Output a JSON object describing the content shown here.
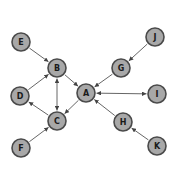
{
  "diagram": {
    "type": "directed-graph",
    "node_radius": 9,
    "colors": {
      "node_fill": "#a8a8a8",
      "node_stroke": "#4a4a4a",
      "edge": "#555555",
      "background": "#ffffff"
    },
    "nodes": [
      {
        "id": "A",
        "label": "A",
        "x": 86,
        "y": 93
      },
      {
        "id": "B",
        "label": "B",
        "x": 57,
        "y": 68
      },
      {
        "id": "C",
        "label": "C",
        "x": 57,
        "y": 121
      },
      {
        "id": "D",
        "label": "D",
        "x": 20,
        "y": 96
      },
      {
        "id": "E",
        "label": "E",
        "x": 21,
        "y": 42
      },
      {
        "id": "F",
        "label": "F",
        "x": 21,
        "y": 148
      },
      {
        "id": "G",
        "label": "G",
        "x": 121,
        "y": 68
      },
      {
        "id": "H",
        "label": "H",
        "x": 123,
        "y": 122
      },
      {
        "id": "I",
        "label": "I",
        "x": 157,
        "y": 94
      },
      {
        "id": "J",
        "label": "J",
        "x": 155,
        "y": 37
      },
      {
        "id": "K",
        "label": "K",
        "x": 157,
        "y": 146
      }
    ],
    "edges": [
      {
        "from": "E",
        "to": "B",
        "bidirectional": false
      },
      {
        "from": "D",
        "to": "B",
        "bidirectional": false
      },
      {
        "from": "B",
        "to": "C",
        "bidirectional": true
      },
      {
        "from": "B",
        "to": "A",
        "bidirectional": false
      },
      {
        "from": "A",
        "to": "C",
        "bidirectional": false
      },
      {
        "from": "C",
        "to": "D",
        "bidirectional": false
      },
      {
        "from": "F",
        "to": "C",
        "bidirectional": false
      },
      {
        "from": "J",
        "to": "G",
        "bidirectional": false
      },
      {
        "from": "G",
        "to": "A",
        "bidirectional": false
      },
      {
        "from": "A",
        "to": "I",
        "bidirectional": true
      },
      {
        "from": "H",
        "to": "A",
        "bidirectional": false
      },
      {
        "from": "K",
        "to": "H",
        "bidirectional": false
      }
    ]
  }
}
